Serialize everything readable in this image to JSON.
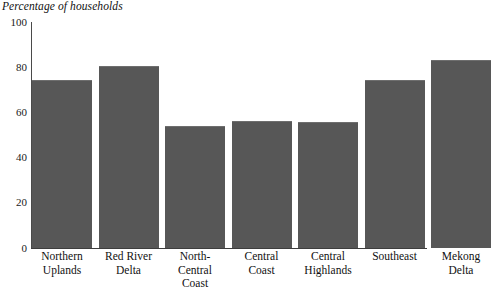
{
  "chart_data": {
    "type": "bar",
    "title": "Percentage of households",
    "xlabel": "",
    "ylabel": "",
    "ylim": [
      0,
      100
    ],
    "yticks": [
      0,
      20,
      40,
      60,
      80,
      100
    ],
    "ytick_labels": [
      "0",
      "20",
      "40",
      "60",
      "80",
      "100"
    ],
    "grid": false,
    "legend": false,
    "bar_color": "#575757",
    "categories": [
      "Northern Uplands",
      "Red River Delta",
      "North-Central Coast",
      "Central Coast",
      "Central Highlands",
      "Southeast",
      "Mekong Delta"
    ],
    "category_lines": [
      [
        "Northern",
        "Uplands"
      ],
      [
        "Red River",
        "Delta"
      ],
      [
        "North-",
        "Central",
        "Coast"
      ],
      [
        "Central",
        "Coast"
      ],
      [
        "Central",
        "Highlands"
      ],
      [
        "Southeast"
      ],
      [
        "Mekong",
        "Delta"
      ]
    ],
    "values": [
      74.5,
      80.5,
      54,
      56,
      55.8,
      74.5,
      83
    ]
  }
}
